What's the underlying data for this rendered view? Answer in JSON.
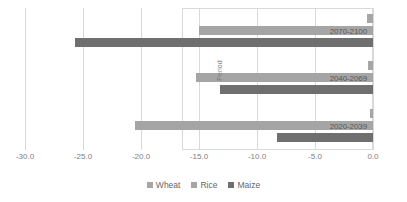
{
  "chart_data": {
    "type": "bar",
    "orientation": "horizontal",
    "title": "",
    "xlabel": "",
    "ylabel": "Period",
    "xlim": [
      -30.0,
      0.0
    ],
    "grid": true,
    "legend_position": "bottom",
    "categories": [
      "2020-2039",
      "2040-2069",
      "2070-2100"
    ],
    "series": [
      {
        "name": "Wheat",
        "color": "#a6a6a6",
        "values": [
          -0.3,
          -0.4,
          -0.5
        ]
      },
      {
        "name": "Rice",
        "color": "#a5a5a5",
        "values": [
          -20.5,
          -15.3,
          -15.0
        ]
      },
      {
        "name": "Maize",
        "color": "#6f6f6f",
        "values": [
          -8.3,
          -13.2,
          -25.7
        ]
      }
    ],
    "xticks": [
      -30.0,
      -25.0,
      -20.0,
      -15.0,
      -10.0,
      -5.0,
      0.0
    ],
    "xtick_labels": [
      "-30.0",
      "-25.0",
      "-20.0",
      "-15.0",
      "-10.0",
      "-5.0",
      "0.0"
    ]
  },
  "legend": {
    "items": [
      {
        "label": "Wheat",
        "color": "#a6a6a6"
      },
      {
        "label": "Rice",
        "color": "#a5a5a5"
      },
      {
        "label": "Maize",
        "color": "#6f6f6f"
      }
    ]
  },
  "axis": {
    "y_title": "Period"
  }
}
